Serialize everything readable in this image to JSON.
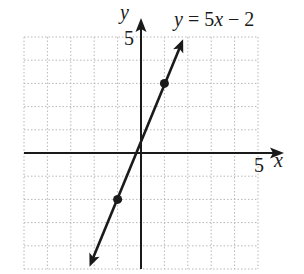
{
  "chart_data": {
    "type": "line",
    "title": "y = 5x − 2",
    "xlabel": "x",
    "ylabel": "y",
    "xlim": [
      -5,
      5
    ],
    "ylim": [
      -5,
      5
    ],
    "grid": true,
    "grid_step": 1,
    "x_tick_labels": [
      {
        "value": 5,
        "label": "5"
      }
    ],
    "y_tick_labels": [
      {
        "value": 5,
        "label": "5"
      }
    ],
    "series": [
      {
        "name": "y = 5x − 2",
        "line_endpoints": [
          {
            "x": -2.2,
            "y": -4.9
          },
          {
            "x": 1.8,
            "y": 4.9
          }
        ],
        "marked_points": [
          {
            "x": -1,
            "y": -2
          },
          {
            "x": 1,
            "y": 3
          }
        ],
        "arrows_both_ends": true
      }
    ],
    "legend": "none"
  },
  "labels": {
    "equation_y": "y",
    "equation_rest": " = 5",
    "equation_x": "x",
    "equation_tail": " − 2",
    "y_axis": "y",
    "x_axis": "x",
    "y_tick_top": "5",
    "x_tick_right": "5"
  },
  "colors": {
    "axis": "#1a1a1a",
    "line": "#1a1a1a",
    "grid": "#b8b8b8",
    "background": "#ffffff"
  }
}
